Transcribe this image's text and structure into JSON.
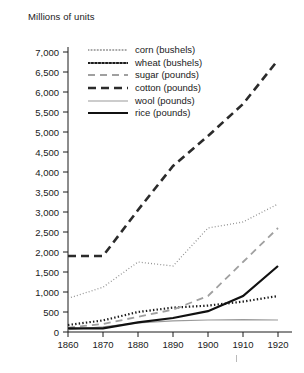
{
  "chart_data": {
    "type": "line",
    "title": "",
    "ylabel": "Millions of units",
    "xlabel": "",
    "xlim": [
      1860,
      1920
    ],
    "ylim": [
      0,
      7000
    ],
    "grid": false,
    "legend_position": "top-left-inside",
    "x": [
      1860,
      1870,
      1880,
      1890,
      1900,
      1910,
      1920
    ],
    "xticks": [
      "1860",
      "1870",
      "1880",
      "1890",
      "1900",
      "1910",
      "1920"
    ],
    "yticks": [
      "0",
      "500",
      "1,000",
      "1,500",
      "2,000",
      "2,500",
      "3,000",
      "3,500",
      "4,000",
      "4,500",
      "5,000",
      "5,500",
      "6,000",
      "6,500",
      "7,000"
    ],
    "series": [
      {
        "name": "corn (bushels)",
        "unit": "bushels",
        "style": "fine-dotted",
        "color": "#8c8c8c",
        "values": [
          840,
          1120,
          1750,
          1650,
          2600,
          2750,
          3200
        ]
      },
      {
        "name": "wheat (bushels)",
        "unit": "bushels",
        "style": "bold-dotted",
        "color": "#1a1a1a",
        "values": [
          175,
          290,
          500,
          610,
          660,
          760,
          900
        ]
      },
      {
        "name": "sugar (pounds)",
        "unit": "pounds",
        "style": "light-dashed",
        "color": "#a0a0a0",
        "values": [
          110,
          200,
          380,
          560,
          900,
          1750,
          2600
        ]
      },
      {
        "name": "cotton (pounds)",
        "unit": "pounds",
        "style": "bold-dashed",
        "color": "#2b2b2b",
        "values": [
          1900,
          1900,
          3050,
          4150,
          4900,
          5700,
          6800
        ]
      },
      {
        "name": "wool (pounds)",
        "unit": "pounds",
        "style": "thin-solid",
        "color": "#9a9a9a",
        "values": [
          60,
          130,
          230,
          280,
          300,
          310,
          300
        ]
      },
      {
        "name": "rice (pounds)",
        "unit": "pounds",
        "style": "bold-solid",
        "color": "#111111",
        "values": [
          90,
          90,
          240,
          350,
          520,
          900,
          1650
        ]
      }
    ]
  },
  "axis": {
    "ylabel": "Millions of units"
  }
}
